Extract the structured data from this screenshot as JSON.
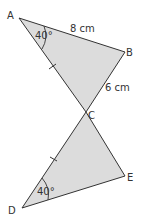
{
  "diagram": {
    "type": "geometry-figure",
    "colors": {
      "fill": "#dcdcdc",
      "stroke": "#333333",
      "text": "#333333"
    },
    "vertices": {
      "A": {
        "label": "A",
        "x": 19,
        "y": 18
      },
      "B": {
        "label": "B",
        "x": 125,
        "y": 52
      },
      "C": {
        "label": "C",
        "x": 86,
        "y": 112
      },
      "D": {
        "label": "D",
        "x": 22,
        "y": 208
      },
      "E": {
        "label": "E",
        "x": 125,
        "y": 176
      }
    },
    "triangles": [
      "ABC",
      "CDE"
    ],
    "side_labels": {
      "AB": "8 cm",
      "BC": "6 cm"
    },
    "angle_labels": {
      "A": "40°",
      "D": "40°"
    },
    "equal_marks": [
      "AC",
      "CD"
    ]
  }
}
